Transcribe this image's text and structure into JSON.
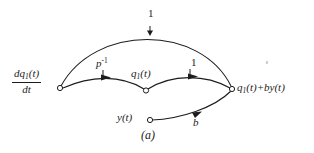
{
  "figure": {
    "caption": "(a)",
    "type": "signal-flow-graph",
    "background_color": "#ffffff",
    "line_color": "#1c1c1c"
  },
  "nodes": [
    {
      "id": "source",
      "label_parts": {
        "numerator_d": "d",
        "numerator_q": "q",
        "numerator_sub": "1",
        "numerator_t": "(t)",
        "denominator": "dt"
      },
      "x": 60,
      "y": 88
    },
    {
      "id": "q1",
      "label_main": "q",
      "label_sub": "1",
      "label_tail": "(t)",
      "x": 146,
      "y": 90
    },
    {
      "id": "y",
      "label_main": "y",
      "label_tail": "(t)",
      "x": 150,
      "y": 120
    },
    {
      "id": "output",
      "label_main": "q",
      "label_sub": "1",
      "label_tail": "(t)+",
      "label_tail2": "by",
      "label_tail3": "(t)",
      "x": 232,
      "y": 89
    }
  ],
  "edges": [
    {
      "id": "top-arc",
      "from": "source",
      "to": "output",
      "gain": "1",
      "gain_x": 148,
      "gain_y": 8
    },
    {
      "id": "p-inverse",
      "from": "source",
      "to": "q1",
      "gain": "p",
      "gain_exponent": "-1",
      "gain_x": 96,
      "gain_y": 57
    },
    {
      "id": "unity-mid",
      "from": "q1",
      "to": "output",
      "gain": "1",
      "gain_x": 191,
      "gain_y": 57
    },
    {
      "id": "b-branch",
      "from": "y",
      "to": "output",
      "gain": "b",
      "gain_x": 193,
      "gain_y": 117
    }
  ]
}
